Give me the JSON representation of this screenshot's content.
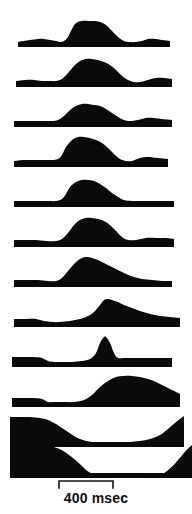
{
  "figure": {
    "title": "",
    "background_color": "#ffffff",
    "trace_color": "#0a0a0a",
    "width": 192,
    "height": 514
  },
  "scalebar": {
    "label": "400 msec",
    "value": 400,
    "unit": "msec",
    "x_start": 59,
    "x_end": 113,
    "tick_height": 7,
    "color": "#111111"
  },
  "chart_data": {
    "type": "area",
    "title": "",
    "subtitle": "",
    "xlabel": "400 msec",
    "ylabel": "",
    "grid": false,
    "legend": null,
    "annotations": [
      "400 msec"
    ],
    "axis_ranges": {
      "x": [
        0,
        192
      ],
      "y_per_trace": [
        0,
        40
      ]
    },
    "layout": {
      "n_traces": 12,
      "orientation": "stacked-vertical",
      "baseline_thickness_px": 5,
      "trace_pitch_px": 40,
      "scale_bar_ms": 400,
      "scale_bar_px": 54
    },
    "series": [
      {
        "name": "trace-1",
        "baseline_y": 47,
        "x": [
          18,
          30,
          38,
          44,
          50,
          56,
          60,
          64,
          68,
          72,
          76,
          82,
          88,
          94,
          100,
          106,
          112,
          118,
          124,
          130,
          136,
          142,
          148,
          156,
          162,
          170
        ],
        "values": [
          5,
          7,
          8,
          8,
          7,
          6,
          5,
          6,
          10,
          18,
          24,
          26,
          26,
          26,
          25,
          22,
          16,
          10,
          6,
          5,
          5,
          6,
          8,
          8,
          7,
          6
        ]
      },
      {
        "name": "trace-2",
        "baseline_y": 87,
        "x": [
          16,
          26,
          34,
          42,
          50,
          56,
          62,
          68,
          74,
          80,
          86,
          92,
          98,
          104,
          110,
          116,
          122,
          128,
          134,
          140,
          148,
          156,
          164,
          172
        ],
        "values": [
          6,
          7,
          7,
          6,
          6,
          6,
          8,
          14,
          21,
          26,
          28,
          28,
          27,
          25,
          22,
          17,
          11,
          7,
          5,
          5,
          7,
          9,
          9,
          8
        ]
      },
      {
        "name": "trace-3",
        "baseline_y": 127,
        "x": [
          14,
          24,
          34,
          44,
          52,
          58,
          64,
          70,
          76,
          82,
          88,
          94,
          100,
          106,
          112,
          118,
          124,
          130,
          138,
          146,
          154,
          162,
          172
        ],
        "values": [
          6,
          6,
          6,
          6,
          6,
          7,
          11,
          17,
          21,
          23,
          23,
          22,
          21,
          18,
          14,
          10,
          7,
          6,
          7,
          9,
          9,
          8,
          7
        ]
      },
      {
        "name": "trace-4",
        "baseline_y": 167,
        "x": [
          14,
          24,
          34,
          44,
          52,
          58,
          62,
          66,
          72,
          78,
          84,
          90,
          96,
          102,
          108,
          114,
          120,
          126,
          132,
          140,
          148,
          158,
          168
        ],
        "values": [
          6,
          7,
          7,
          7,
          7,
          8,
          12,
          20,
          27,
          30,
          30,
          29,
          27,
          24,
          19,
          13,
          8,
          6,
          6,
          9,
          10,
          9,
          8
        ]
      },
      {
        "name": "trace-5",
        "baseline_y": 207,
        "x": [
          14,
          26,
          38,
          48,
          56,
          62,
          66,
          70,
          76,
          82,
          88,
          94,
          100,
          106,
          112,
          118,
          124,
          132,
          142,
          152,
          164,
          174
        ],
        "values": [
          6,
          6,
          6,
          6,
          6,
          8,
          13,
          20,
          25,
          27,
          27,
          26,
          23,
          19,
          14,
          10,
          7,
          6,
          6,
          6,
          6,
          6
        ]
      },
      {
        "name": "trace-6",
        "baseline_y": 247,
        "x": [
          14,
          26,
          36,
          46,
          56,
          62,
          68,
          74,
          80,
          86,
          92,
          98,
          104,
          110,
          116,
          122,
          128,
          136,
          146,
          156,
          166,
          174
        ],
        "values": [
          7,
          7,
          7,
          6,
          6,
          8,
          14,
          22,
          27,
          29,
          29,
          28,
          26,
          22,
          16,
          10,
          7,
          7,
          9,
          9,
          9,
          8
        ]
      },
      {
        "name": "trace-7",
        "baseline_y": 287,
        "x": [
          14,
          26,
          38,
          48,
          56,
          62,
          68,
          74,
          80,
          86,
          92,
          98,
          104,
          110,
          118,
          126,
          134,
          142,
          152,
          162,
          172
        ],
        "values": [
          7,
          7,
          7,
          6,
          6,
          9,
          16,
          23,
          28,
          30,
          29,
          27,
          24,
          21,
          17,
          13,
          10,
          8,
          7,
          6,
          6
        ]
      },
      {
        "name": "trace-8",
        "baseline_y": 327,
        "x": [
          14,
          26,
          36,
          44,
          52,
          60,
          70,
          80,
          88,
          94,
          100,
          104,
          108,
          112,
          118,
          124,
          132,
          140,
          150,
          160,
          170,
          180
        ],
        "values": [
          8,
          8,
          8,
          6,
          5,
          5,
          6,
          8,
          11,
          15,
          22,
          27,
          28,
          27,
          25,
          22,
          19,
          16,
          13,
          11,
          10,
          9
        ]
      },
      {
        "name": "trace-9",
        "baseline_y": 367,
        "x": [
          12,
          24,
          34,
          42,
          48,
          54,
          62,
          72,
          82,
          90,
          96,
          100,
          104,
          106,
          110,
          114,
          118,
          124,
          132,
          142,
          152,
          162,
          172
        ],
        "values": [
          10,
          10,
          10,
          9,
          6,
          4,
          4,
          5,
          6,
          8,
          14,
          24,
          30,
          30,
          24,
          14,
          9,
          9,
          9,
          9,
          9,
          9,
          9
        ]
      },
      {
        "name": "trace-10",
        "baseline_y": 407,
        "x": [
          12,
          24,
          34,
          42,
          48,
          54,
          64,
          74,
          84,
          92,
          100,
          108,
          116,
          124,
          132,
          140,
          148,
          156,
          164,
          172,
          180
        ],
        "values": [
          9,
          9,
          9,
          8,
          5,
          4,
          4,
          5,
          7,
          12,
          20,
          26,
          30,
          31,
          31,
          30,
          28,
          25,
          21,
          17,
          13
        ]
      },
      {
        "name": "trace-11",
        "baseline_y": 447,
        "x": [
          10,
          20,
          30,
          40,
          48,
          56,
          62,
          68,
          74,
          80,
          86,
          92,
          100,
          110,
          120,
          130,
          140,
          150,
          160,
          168,
          176,
          184
        ],
        "values": [
          30,
          30,
          30,
          29,
          27,
          23,
          19,
          15,
          11,
          8,
          6,
          5,
          5,
          5,
          5,
          5,
          6,
          8,
          12,
          18,
          25,
          31
        ]
      },
      {
        "name": "trace-12",
        "baseline_y": 478,
        "x": [
          10,
          60,
          113,
          184
        ],
        "values": [
          0,
          0,
          0,
          0
        ]
      }
    ]
  }
}
